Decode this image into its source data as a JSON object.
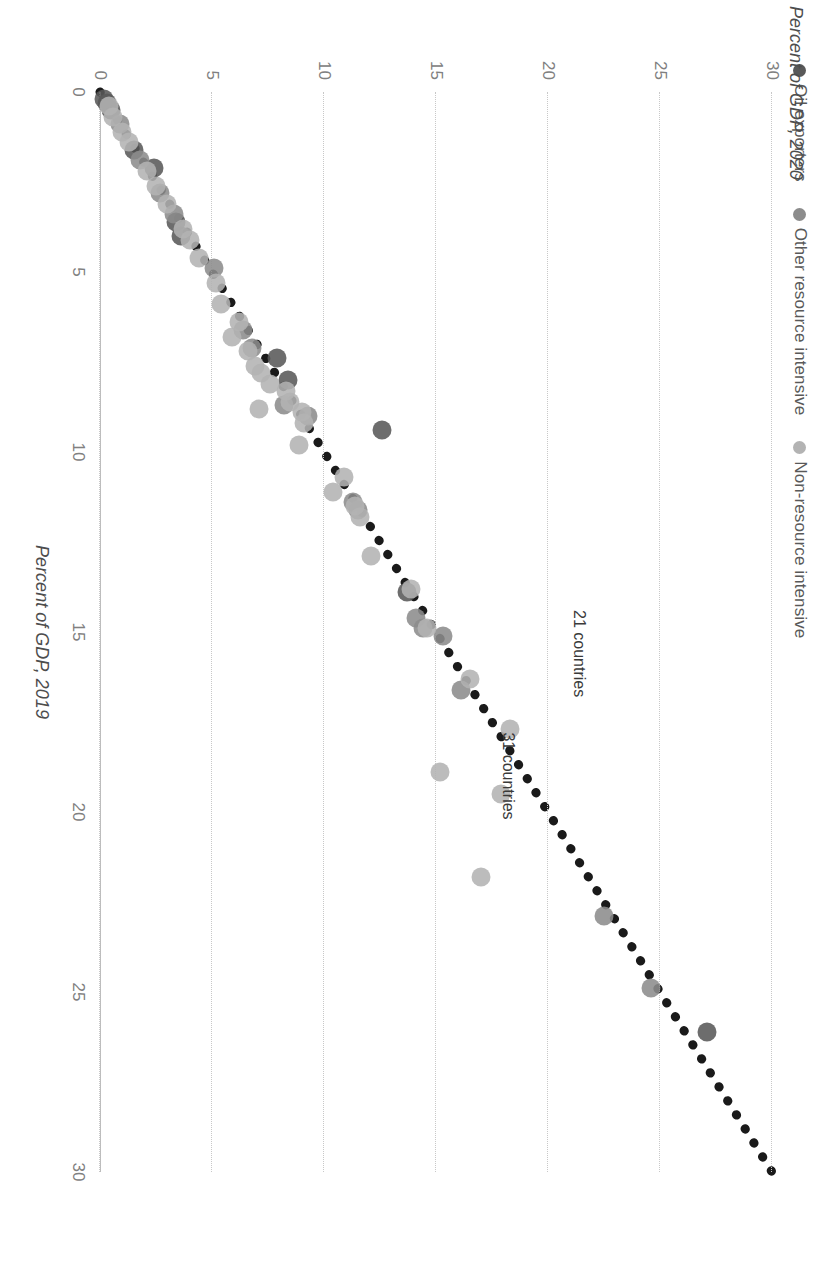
{
  "legend": {
    "items": [
      {
        "label": "Oil exporters",
        "color": "#595959",
        "key": "oil"
      },
      {
        "label": "Other resource intensive",
        "color": "#8c8c8c",
        "key": "other"
      },
      {
        "label": "Non-resource intensive",
        "color": "#b3b3b3",
        "key": "nonres"
      }
    ]
  },
  "annotations": [
    {
      "text": "21 countries",
      "x": 15.6,
      "y": 21.4,
      "rotate": 0
    },
    {
      "text": "31 countries",
      "x": 19.0,
      "y": 18.2,
      "rotate": 0
    }
  ],
  "chart_data": {
    "type": "scatter",
    "title": "",
    "xlabel": "Percent of GDP, 2019",
    "ylabel": "Percent of GDP, 2020",
    "xlim": [
      0,
      30
    ],
    "ylim": [
      0,
      30
    ],
    "xticks": [
      0,
      5,
      10,
      15,
      20,
      25,
      30
    ],
    "yticks": [
      0,
      5,
      10,
      15,
      20,
      25,
      30
    ],
    "grid": "y-gridlines dotted",
    "legend_position": "top-left",
    "reference_line": {
      "label": "45-degree line",
      "style": "dotted",
      "color": "#1a1a1a",
      "from": [
        0,
        0
      ],
      "to": [
        30,
        30
      ]
    },
    "series": [
      {
        "name": "Oil exporters",
        "color": "#595959",
        "points": [
          [
            26.1,
            27.1
          ],
          [
            13.9,
            13.7
          ],
          [
            9.4,
            12.6
          ],
          [
            8.0,
            8.4
          ],
          [
            7.4,
            7.9
          ],
          [
            4.0,
            3.6
          ],
          [
            3.6,
            3.4
          ],
          [
            2.1,
            2.4
          ],
          [
            1.6,
            1.5
          ],
          [
            0.5,
            0.5
          ],
          [
            0.3,
            0.3
          ],
          [
            0.2,
            0.2
          ]
        ]
      },
      {
        "name": "Other resource intensive",
        "color": "#8c8c8c",
        "points": [
          [
            24.9,
            24.6
          ],
          [
            22.9,
            22.5
          ],
          [
            16.6,
            16.1
          ],
          [
            15.1,
            15.3
          ],
          [
            14.9,
            14.4
          ],
          [
            14.6,
            14.1
          ],
          [
            11.6,
            11.5
          ],
          [
            11.4,
            11.3
          ],
          [
            9.0,
            9.3
          ],
          [
            8.7,
            8.2
          ],
          [
            7.1,
            6.8
          ],
          [
            6.6,
            6.4
          ],
          [
            4.9,
            5.1
          ],
          [
            3.4,
            3.3
          ],
          [
            2.8,
            2.7
          ],
          [
            1.9,
            1.8
          ],
          [
            0.9,
            0.9
          ]
        ]
      },
      {
        "name": "Non-resource intensive",
        "color": "#b3b3b3",
        "points": [
          [
            21.8,
            17.0
          ],
          [
            19.5,
            17.9
          ],
          [
            18.9,
            15.2
          ],
          [
            17.7,
            18.3
          ],
          [
            16.3,
            16.5
          ],
          [
            14.9,
            14.6
          ],
          [
            13.8,
            13.9
          ],
          [
            12.9,
            12.1
          ],
          [
            11.8,
            11.6
          ],
          [
            11.5,
            11.4
          ],
          [
            11.1,
            10.4
          ],
          [
            10.7,
            10.9
          ],
          [
            9.8,
            8.9
          ],
          [
            9.2,
            9.1
          ],
          [
            8.9,
            9.0
          ],
          [
            8.8,
            7.1
          ],
          [
            8.6,
            8.5
          ],
          [
            8.3,
            8.3
          ],
          [
            8.1,
            7.6
          ],
          [
            7.8,
            7.2
          ],
          [
            7.6,
            6.9
          ],
          [
            7.2,
            6.6
          ],
          [
            6.8,
            5.9
          ],
          [
            6.4,
            6.2
          ],
          [
            5.9,
            5.4
          ],
          [
            5.3,
            5.2
          ],
          [
            4.6,
            4.4
          ],
          [
            4.1,
            4.0
          ],
          [
            3.8,
            3.7
          ],
          [
            3.1,
            3.0
          ],
          [
            2.6,
            2.5
          ],
          [
            2.2,
            2.1
          ],
          [
            1.4,
            1.3
          ],
          [
            1.1,
            1.0
          ],
          [
            0.7,
            0.6
          ],
          [
            0.4,
            0.4
          ]
        ]
      }
    ]
  }
}
